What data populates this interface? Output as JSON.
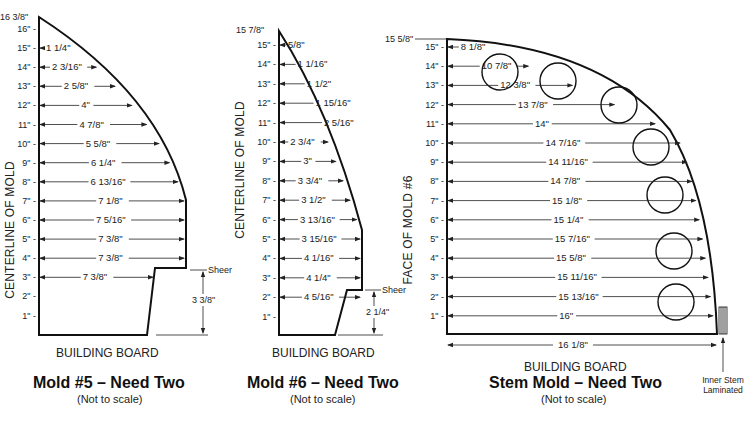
{
  "molds": [
    {
      "id": "mold5",
      "title": "Mold #5 – Need Two",
      "subtitle": "(Not to scale)",
      "board_label": "BUILDING BOARD",
      "axis_label": "CENTERLINE OF MOLD",
      "top_label": "16 3/8\"",
      "sheer_label": "Sheer",
      "sheer_height": "3 3/8\"",
      "rows": [
        {
          "height": "16\"",
          "width": ""
        },
        {
          "height": "15\"",
          "width": "1 1/4\""
        },
        {
          "height": "14\"",
          "width": "2 3/16\""
        },
        {
          "height": "13\"",
          "width": "2 5/8\""
        },
        {
          "height": "12\"",
          "width": "4\""
        },
        {
          "height": "11\"",
          "width": "4 7/8\""
        },
        {
          "height": "10\"",
          "width": "5 5/8\""
        },
        {
          "height": "9\"",
          "width": "6 1/4\""
        },
        {
          "height": "8\"",
          "width": "6 13/16\""
        },
        {
          "height": "7\"",
          "width": "7 1/8\""
        },
        {
          "height": "6\"",
          "width": "7 5/16\""
        },
        {
          "height": "5\"",
          "width": "7 3/8\""
        },
        {
          "height": "4\"",
          "width": "7 3/8\""
        },
        {
          "height": "3\"",
          "width": "7 3/8\""
        },
        {
          "height": "2\"",
          "width": ""
        },
        {
          "height": "1\"",
          "width": ""
        }
      ]
    },
    {
      "id": "mold6",
      "title": "Mold #6 – Need Two",
      "subtitle": "(Not to scale)",
      "board_label": "BUILDING BOARD",
      "axis_label": "CENTERLINE OF MOLD",
      "top_label": "15 7/8\"",
      "sheer_label": "Sheer",
      "sheer_height": "2 1/4\"",
      "rows": [
        {
          "height": "15\"",
          "width": "5/8\""
        },
        {
          "height": "14\"",
          "width": "1 1/16\""
        },
        {
          "height": "13\"",
          "width": "1 1/2\""
        },
        {
          "height": "12\"",
          "width": "1 15/16\""
        },
        {
          "height": "11\"",
          "width": "2 5/16\""
        },
        {
          "height": "10\"",
          "width": "2 3/4\""
        },
        {
          "height": "9\"",
          "width": "3\""
        },
        {
          "height": "8\"",
          "width": "3 3/4\""
        },
        {
          "height": "7\"",
          "width": "3 1/2\""
        },
        {
          "height": "6\"",
          "width": "3 13/16\""
        },
        {
          "height": "5\"",
          "width": "3 15/16\""
        },
        {
          "height": "4\"",
          "width": "4 1/16\""
        },
        {
          "height": "3\"",
          "width": "4 1/4\""
        },
        {
          "height": "2\"",
          "width": "4 5/16\""
        },
        {
          "height": "1\"",
          "width": ""
        }
      ]
    },
    {
      "id": "stem",
      "title": "Stem Mold – Need Two",
      "subtitle": "(Not to scale)",
      "board_label": "BUILDING BOARD",
      "axis_label": "FACE OF MOLD #6",
      "top_label": "15 5/8\"",
      "base_width": "16 1/8\"",
      "inner_stem_label": [
        "Inner Stem",
        "Laminated"
      ],
      "rows": [
        {
          "height": "15\"",
          "width": "8 1/8\""
        },
        {
          "height": "14\"",
          "width": "10 7/8\""
        },
        {
          "height": "13\"",
          "width": "12 3/8\""
        },
        {
          "height": "12\"",
          "width": "13 7/8\""
        },
        {
          "height": "11\"",
          "width": "14\""
        },
        {
          "height": "10\"",
          "width": "14 7/16\""
        },
        {
          "height": "9\"",
          "width": "14 11/16\""
        },
        {
          "height": "8\"",
          "width": "14 7/8\""
        },
        {
          "height": "7\"",
          "width": "15 1/8\""
        },
        {
          "height": "6\"",
          "width": "15 1/4\""
        },
        {
          "height": "5\"",
          "width": "15 7/16\""
        },
        {
          "height": "4\"",
          "width": "15 5/8\""
        },
        {
          "height": "3\"",
          "width": "15 11/16\""
        },
        {
          "height": "2\"",
          "width": "15 13/16\""
        },
        {
          "height": "1\"",
          "width": "16\""
        }
      ]
    }
  ],
  "colors": {
    "line": "#111111",
    "text": "#222222",
    "background": "#ffffff"
  }
}
